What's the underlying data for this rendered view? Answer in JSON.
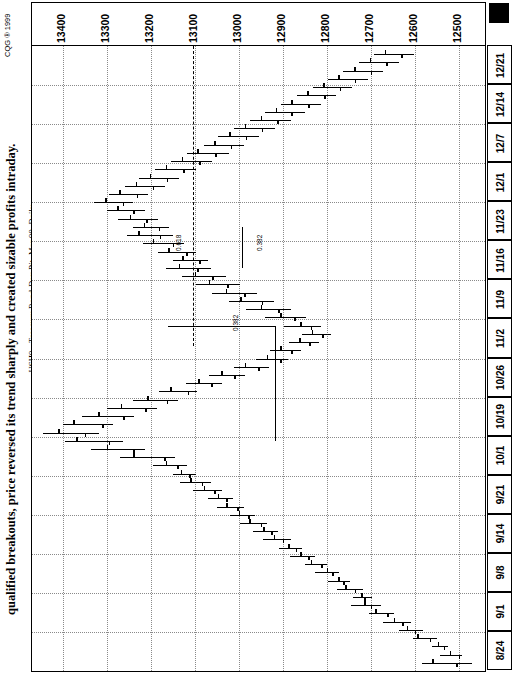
{
  "caption": "qualified breakouts, price reversed its trend sharply and created sizable profits intraday.",
  "chart_title": "USH9 - Treasury Bond-Day Pit, Mar 99, Daily",
  "copyright": "CQG ® 1999",
  "annotations": [
    {
      "name": "fib-0618",
      "label": "0.618"
    },
    {
      "name": "fib-0382-upper",
      "label": "0.382"
    },
    {
      "name": "fib-0382-lower",
      "label": "0.382"
    }
  ],
  "chart_data": {
    "type": "bar",
    "subtype": "ohlc-bar-rotated",
    "title": "USH9 - Treasury Bond-Day Pit, Mar 99, Daily",
    "xlabel": "",
    "ylabel": "",
    "orientation": "rotated-90ccw",
    "grid": true,
    "legend": "none",
    "price_axis": {
      "position": "top",
      "ticks": [
        13400,
        13300,
        13200,
        13100,
        13000,
        12900,
        12800,
        12700,
        12600,
        12500
      ],
      "range": [
        12440,
        13470
      ],
      "direction": "descending-left-to-right"
    },
    "date_axis": {
      "position": "right",
      "ticks": [
        "12/21",
        "12/14",
        "12/7",
        "12/1",
        "11/23",
        "11/16",
        "11/9",
        "11/2",
        "10/26",
        "10/19",
        "10/1",
        "9/21",
        "9/14",
        "9/8",
        "9/1",
        "8/24"
      ],
      "direction": "oldest-bottom-newest-top"
    },
    "series": [
      {
        "name": "USH9 daily OHLC",
        "values": [
          {
            "i": 0,
            "high": 12583,
            "low": 12470,
            "open": 12560,
            "close": 12505
          },
          {
            "i": 1,
            "high": 12543,
            "low": 12492,
            "open": 12520,
            "close": 12500
          },
          {
            "i": 2,
            "high": 12560,
            "low": 12524,
            "open": 12548,
            "close": 12534
          },
          {
            "i": 3,
            "high": 12604,
            "low": 12548,
            "open": 12594,
            "close": 12566
          },
          {
            "i": 4,
            "high": 12636,
            "low": 12580,
            "open": 12618,
            "close": 12600
          },
          {
            "i": 5,
            "high": 12672,
            "low": 12608,
            "open": 12648,
            "close": 12628
          },
          {
            "i": 6,
            "high": 12704,
            "low": 12648,
            "open": 12690,
            "close": 12662
          },
          {
            "i": 7,
            "high": 12744,
            "low": 12676,
            "open": 12714,
            "close": 12700
          },
          {
            "i": 8,
            "high": 12740,
            "low": 12696,
            "open": 12722,
            "close": 12714
          },
          {
            "i": 9,
            "high": 12776,
            "low": 12718,
            "open": 12758,
            "close": 12736
          },
          {
            "i": 10,
            "high": 12796,
            "low": 12748,
            "open": 12774,
            "close": 12762
          },
          {
            "i": 11,
            "high": 12826,
            "low": 12772,
            "open": 12800,
            "close": 12788
          },
          {
            "i": 12,
            "high": 12850,
            "low": 12800,
            "open": 12836,
            "close": 12812
          },
          {
            "i": 13,
            "high": 12884,
            "low": 12826,
            "open": 12860,
            "close": 12842
          },
          {
            "i": 14,
            "high": 12908,
            "low": 12856,
            "open": 12888,
            "close": 12870
          },
          {
            "i": 15,
            "high": 12944,
            "low": 12880,
            "open": 12920,
            "close": 12900
          },
          {
            "i": 16,
            "high": 12968,
            "low": 12910,
            "open": 12944,
            "close": 12926
          },
          {
            "i": 17,
            "high": 12996,
            "low": 12936,
            "open": 12976,
            "close": 12950
          },
          {
            "i": 18,
            "high": 13020,
            "low": 12962,
            "open": 13000,
            "close": 12978
          },
          {
            "i": 19,
            "high": 13050,
            "low": 12988,
            "open": 13028,
            "close": 13004
          },
          {
            "i": 20,
            "high": 13070,
            "low": 13012,
            "open": 13048,
            "close": 13028
          },
          {
            "i": 21,
            "high": 13104,
            "low": 13038,
            "open": 13080,
            "close": 13056
          },
          {
            "i": 22,
            "high": 13134,
            "low": 13064,
            "open": 13110,
            "close": 13084
          },
          {
            "i": 23,
            "high": 13150,
            "low": 13096,
            "open": 13132,
            "close": 13112
          },
          {
            "i": 24,
            "high": 13196,
            "low": 13118,
            "open": 13166,
            "close": 13140
          },
          {
            "i": 25,
            "high": 13270,
            "low": 13144,
            "open": 13240,
            "close": 13170
          },
          {
            "i": 26,
            "high": 13336,
            "low": 13212,
            "open": 13300,
            "close": 13240
          },
          {
            "i": 27,
            "high": 13396,
            "low": 13262,
            "open": 13370,
            "close": 13296
          },
          {
            "i": 28,
            "high": 13444,
            "low": 13318,
            "open": 13410,
            "close": 13350
          },
          {
            "i": 29,
            "high": 13400,
            "low": 13286,
            "open": 13376,
            "close": 13310
          },
          {
            "i": 30,
            "high": 13356,
            "low": 13238,
            "open": 13320,
            "close": 13262
          },
          {
            "i": 31,
            "high": 13300,
            "low": 13186,
            "open": 13268,
            "close": 13212
          },
          {
            "i": 32,
            "high": 13240,
            "low": 13138,
            "open": 13208,
            "close": 13164
          },
          {
            "i": 33,
            "high": 13182,
            "low": 13094,
            "open": 13156,
            "close": 13116
          },
          {
            "i": 34,
            "high": 13120,
            "low": 13038,
            "open": 13092,
            "close": 13062
          },
          {
            "i": 35,
            "high": 13068,
            "low": 12986,
            "open": 13040,
            "close": 13010
          },
          {
            "i": 36,
            "high": 13010,
            "low": 12932,
            "open": 12986,
            "close": 12956
          },
          {
            "i": 37,
            "high": 12960,
            "low": 12888,
            "open": 12936,
            "close": 12906
          },
          {
            "i": 38,
            "high": 12928,
            "low": 12858,
            "open": 12906,
            "close": 12880
          },
          {
            "i": 39,
            "high": 12886,
            "low": 12818,
            "open": 12862,
            "close": 12840
          },
          {
            "i": 40,
            "high": 12856,
            "low": 12790,
            "open": 12834,
            "close": 12810
          },
          {
            "i": 41,
            "high": 12898,
            "low": 12812,
            "open": 12860,
            "close": 12836
          },
          {
            "i": 42,
            "high": 12940,
            "low": 12846,
            "open": 12906,
            "close": 12874
          },
          {
            "i": 43,
            "high": 12984,
            "low": 12880,
            "open": 12950,
            "close": 12910
          },
          {
            "i": 44,
            "high": 13022,
            "low": 12920,
            "open": 12996,
            "close": 12948
          },
          {
            "i": 45,
            "high": 13060,
            "low": 12958,
            "open": 13030,
            "close": 12988
          },
          {
            "i": 46,
            "high": 13098,
            "low": 12996,
            "open": 13068,
            "close": 13026
          },
          {
            "i": 47,
            "high": 13128,
            "low": 13028,
            "open": 13100,
            "close": 13060
          },
          {
            "i": 48,
            "high": 13166,
            "low": 13062,
            "open": 13136,
            "close": 13094
          },
          {
            "i": 49,
            "high": 13150,
            "low": 13070,
            "open": 13128,
            "close": 13090
          },
          {
            "i": 50,
            "high": 13184,
            "low": 13096,
            "open": 13160,
            "close": 13120
          },
          {
            "i": 51,
            "high": 13218,
            "low": 13124,
            "open": 13196,
            "close": 13150
          },
          {
            "i": 52,
            "high": 13254,
            "low": 13150,
            "open": 13228,
            "close": 13180
          },
          {
            "i": 53,
            "high": 13240,
            "low": 13158,
            "open": 13216,
            "close": 13182
          },
          {
            "i": 54,
            "high": 13274,
            "low": 13184,
            "open": 13248,
            "close": 13210
          },
          {
            "i": 55,
            "high": 13300,
            "low": 13214,
            "open": 13276,
            "close": 13240
          },
          {
            "i": 56,
            "high": 13328,
            "low": 13240,
            "open": 13304,
            "close": 13264
          },
          {
            "i": 57,
            "high": 13296,
            "low": 13206,
            "open": 13272,
            "close": 13232
          },
          {
            "i": 58,
            "high": 13258,
            "low": 13168,
            "open": 13234,
            "close": 13196
          },
          {
            "i": 59,
            "high": 13226,
            "low": 13136,
            "open": 13202,
            "close": 13164
          },
          {
            "i": 60,
            "high": 13190,
            "low": 13098,
            "open": 13166,
            "close": 13126
          },
          {
            "i": 61,
            "high": 13154,
            "low": 13060,
            "open": 13130,
            "close": 13090
          },
          {
            "i": 62,
            "high": 13118,
            "low": 13022,
            "open": 13094,
            "close": 13054
          },
          {
            "i": 63,
            "high": 13080,
            "low": 12988,
            "open": 13056,
            "close": 13018
          },
          {
            "i": 64,
            "high": 13046,
            "low": 12954,
            "open": 13022,
            "close": 12984
          },
          {
            "i": 65,
            "high": 13010,
            "low": 12918,
            "open": 12986,
            "close": 12948
          },
          {
            "i": 66,
            "high": 12974,
            "low": 12882,
            "open": 12950,
            "close": 12912
          },
          {
            "i": 67,
            "high": 12940,
            "low": 12850,
            "open": 12916,
            "close": 12880
          },
          {
            "i": 68,
            "high": 12904,
            "low": 12814,
            "open": 12880,
            "close": 12842
          },
          {
            "i": 69,
            "high": 12868,
            "low": 12778,
            "open": 12844,
            "close": 12806
          },
          {
            "i": 70,
            "high": 12832,
            "low": 12742,
            "open": 12808,
            "close": 12770
          },
          {
            "i": 71,
            "high": 12798,
            "low": 12706,
            "open": 12774,
            "close": 12736
          },
          {
            "i": 72,
            "high": 12762,
            "low": 12672,
            "open": 12738,
            "close": 12700
          },
          {
            "i": 73,
            "high": 12726,
            "low": 12636,
            "open": 12702,
            "close": 12664
          },
          {
            "i": 74,
            "high": 12692,
            "low": 12602,
            "open": 12668,
            "close": 12630
          }
        ]
      }
    ]
  }
}
